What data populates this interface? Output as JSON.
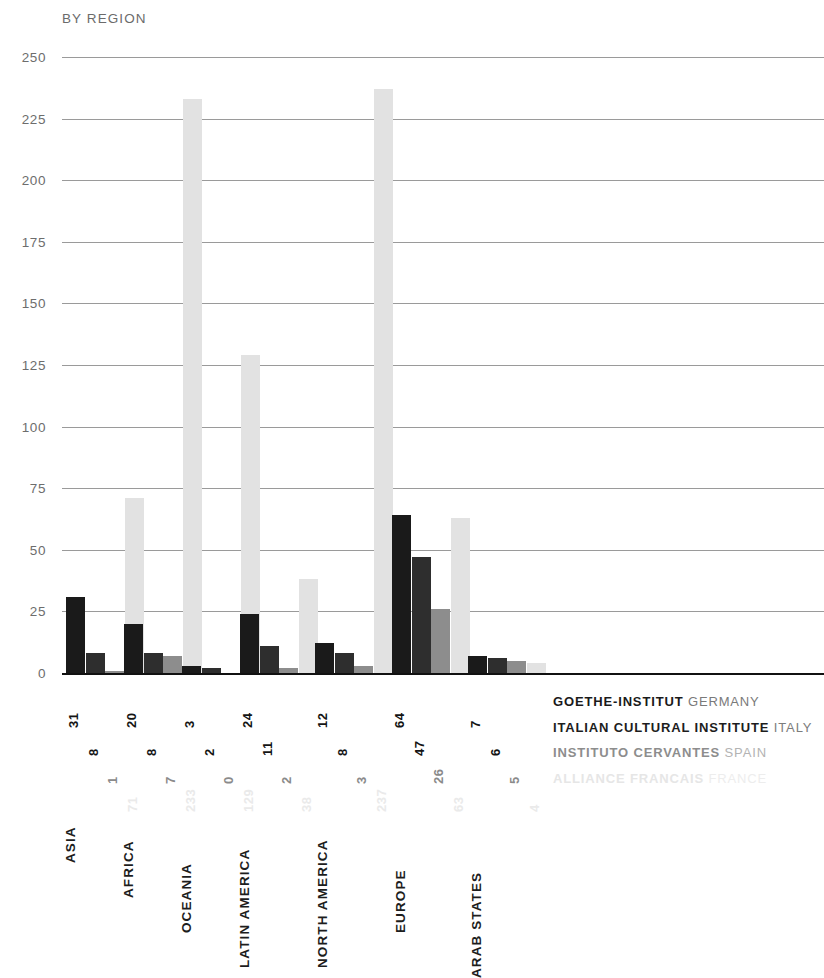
{
  "chart_data": {
    "type": "bar",
    "title": "BY REGION",
    "xlabel": "",
    "ylabel": "",
    "ylim": [
      0,
      250
    ],
    "yticks": [
      250,
      225,
      200,
      175,
      150,
      125,
      100,
      75,
      50,
      25,
      0
    ],
    "grid": true,
    "legend_position": "right-bottom",
    "categories": [
      "ASIA",
      "AFRICA",
      "OCEANIA",
      "LATIN AMERICA",
      "NORTH AMERICA",
      "EUROPE",
      "ARAB STATES"
    ],
    "series": [
      {
        "name": "GOETHE-INSTITUT",
        "country": "GERMANY",
        "color": "#1a1a1a",
        "values": [
          31,
          20,
          3,
          24,
          12,
          64,
          7
        ]
      },
      {
        "name": "ITALIAN CULTURAL INSTITUTE",
        "country": "ITALY",
        "color": "#2e2e2e",
        "values": [
          8,
          8,
          2,
          11,
          8,
          47,
          6
        ]
      },
      {
        "name": "INSTITUTO CERVANTES",
        "country": "SPAIN",
        "color": "#8d8d8d",
        "values": [
          1,
          7,
          0,
          2,
          3,
          26,
          5
        ]
      },
      {
        "name": "ALLIANCE FRANCAIS",
        "country": "FRANCE",
        "color": "#e2e2e2",
        "values": [
          71,
          233,
          129,
          38,
          237,
          63,
          4
        ]
      }
    ]
  },
  "legend": [
    {
      "org": "GOETHE-INSTITUT",
      "country": " GERMANY",
      "org_color": "#1a1a1a",
      "country_color": "#7a7a7a"
    },
    {
      "org": "ITALIAN CULTURAL INSTITUTE",
      "country": " ITALY",
      "org_color": "#1d1d1d",
      "country_color": "#7c7c7c"
    },
    {
      "org": "INSTITUTO CERVANTES",
      "country": " SPAIN",
      "org_color": "#8d8d8d",
      "country_color": "#b3b3b3"
    },
    {
      "org": "ALLIANCE FRANCAIS",
      "country": " FRANCE",
      "org_color": "#e6e6e6",
      "country_color": "#ededed"
    }
  ]
}
